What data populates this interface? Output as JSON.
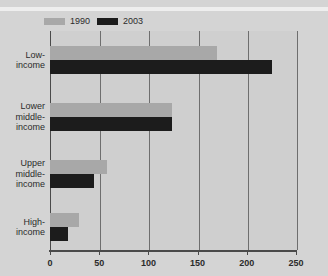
{
  "chart_data": {
    "type": "bar",
    "orientation": "horizontal",
    "title": "",
    "xlabel": "",
    "ylabel": "",
    "categories": [
      "Low-\nincome",
      "Lower\nmiddle-\nincome",
      "Upper\nmiddle-\nincome",
      "High-\nincome"
    ],
    "category_lines": [
      [
        "Low-",
        "income"
      ],
      [
        "Lower",
        "middle-",
        "income"
      ],
      [
        "Upper",
        "middle-",
        "income"
      ],
      [
        "High-",
        "income"
      ]
    ],
    "series": [
      {
        "name": "1990",
        "color": "#a8a8a8",
        "values": [
          170,
          124,
          58,
          29
        ]
      },
      {
        "name": "2003",
        "color": "#1c1c1c",
        "values": [
          226,
          124,
          45,
          18
        ]
      }
    ],
    "xlim": [
      0,
      250
    ],
    "xticks": [
      0,
      50,
      100,
      150,
      200,
      250
    ],
    "xtick_labels": [
      "0",
      "50",
      "100",
      "150",
      "200",
      "250"
    ],
    "grid": true,
    "legend_position": "top-left",
    "background_color": "#d4d4d4",
    "plot_background_color": "#cfcfcf",
    "axis_color": "#4a4a4a",
    "grid_color": "#6e6e6e"
  },
  "legend": {
    "entries": [
      {
        "label": "1990",
        "swatch": "legend-swatch-1990"
      },
      {
        "label": "2003",
        "swatch": "legend-swatch-2003"
      }
    ]
  }
}
